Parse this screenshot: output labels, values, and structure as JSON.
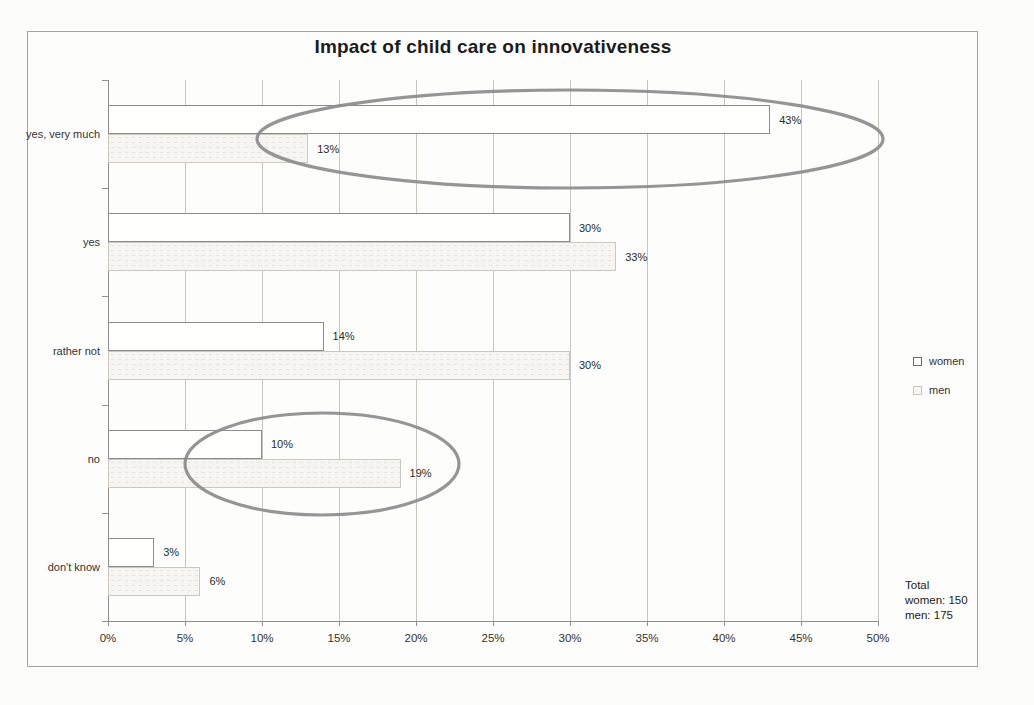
{
  "title": "Impact of child care on innovativeness",
  "chart_data": {
    "type": "bar",
    "orientation": "horizontal",
    "title": "Impact of child care on innovativeness",
    "categories": [
      "yes, very much",
      "yes",
      "rather not",
      "no",
      "don't know"
    ],
    "series": [
      {
        "name": "women",
        "values": [
          43,
          30,
          14,
          10,
          3
        ],
        "fill": "#fffffe",
        "border": "#8c8c8c"
      },
      {
        "name": "men",
        "values": [
          13,
          33,
          30,
          19,
          6
        ],
        "fill": "#f6f5f1",
        "border": "#cbc8c0"
      }
    ],
    "data_label_suffix": "%",
    "xlim": [
      0,
      50
    ],
    "x_ticks": [
      "0%",
      "5%",
      "10%",
      "15%",
      "20%",
      "25%",
      "30%",
      "35%",
      "40%",
      "45%",
      "50%"
    ],
    "grid": "vertical",
    "legend_position": "right-middle",
    "annotations": [
      {
        "type": "ellipse",
        "target": "yes-very-much-both-bars",
        "cx": 462,
        "cy": 59,
        "rx": 313,
        "ry": 49
      },
      {
        "type": "ellipse",
        "target": "no-both-bars",
        "cx": 214,
        "cy": 384,
        "rx": 137,
        "ry": 51
      }
    ],
    "footnote": [
      "Total",
      "women: 150",
      "men:  175"
    ]
  },
  "colors": {
    "grid": "#c6c6c3",
    "axis": "#8f8f8f",
    "frame_border": "#a3a3a0",
    "text": "#2b2b2b",
    "annotation_stroke": "#8a8a8a"
  }
}
